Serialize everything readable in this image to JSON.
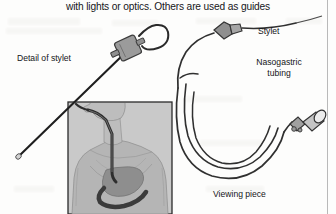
{
  "figure": {
    "caption_top": "with lights or optics. Others are used as guides",
    "labels": {
      "detail_of_stylet": "Detail of stylet",
      "stylet": "Stylet",
      "nasogastric_tubing_line1": "Nasogastric",
      "nasogastric_tubing_line2": "tubing",
      "viewing_piece": "Viewing piece"
    },
    "colors": {
      "page_background": "#fdfdfc",
      "ink": "#1a1a1a",
      "tube_outline": "#3a3a3a",
      "hub_fill": "#9b9b9b",
      "body_fill": "#b5b5b5",
      "organ_fill": "#8e8e8e",
      "inset_background": "#c9c9c9",
      "inset_border": "#2b2b2b",
      "rule": "#b9b9b9"
    },
    "inset": {
      "name": "anatomical-inset",
      "description": "Torso and head in profile showing nasogastric tube passing through the nose, down the esophagus and into the stomach",
      "frame": {
        "x": 68,
        "y": 102,
        "width": 104,
        "height": 112
      }
    },
    "parts": [
      {
        "name": "stylet-wire",
        "description": "thin dark wire running from lower-left to the hub"
      },
      {
        "name": "stylet-hub",
        "description": "gray rectangular connector hub with side flanges"
      },
      {
        "name": "stylet-tip",
        "description": "small blunt rounded tip at the lower-left end of the wire"
      },
      {
        "name": "stylet-connector",
        "description": "gray tapered cone where the stylet meets the nasogastric tubing"
      },
      {
        "name": "nasogastric-tubing",
        "description": "long flexible tube coiled into nested loops"
      },
      {
        "name": "viewing-piece",
        "description": "funnel-shaped eyepiece connector at the tube end"
      }
    ]
  }
}
